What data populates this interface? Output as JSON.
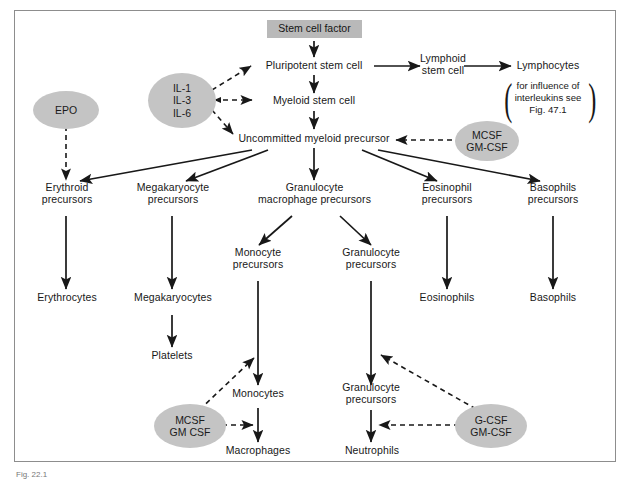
{
  "figure": {
    "caption": "Fig. 22.1",
    "border_color": "#8d8d8d",
    "box_fill": "#b9b9b9",
    "oval_fill": "#c4c4c4",
    "line_color": "#181818"
  },
  "nodes": {
    "stem_cell_factor": "Stem cell factor",
    "pluripotent_stem_cell": "Pluripotent stem cell",
    "myeloid_stem_cell": "Myeloid stem cell",
    "lymphoid_stem_cell": "Lymphoid\nstem cell",
    "lymphocytes": "Lymphocytes",
    "interleukin_note": "for influence of\ninterleukins see\nFig. 47.1",
    "uncommitted_myeloid_precursor": "Uncommitted myeloid precursor",
    "erythroid_precursors": "Erythroid\nprecursors",
    "megakaryocyte_precursors": "Megakaryocyte\nprecursors",
    "granulocyte_macrophage_precursors": "Granulocyte\nmacrophage precursors",
    "eosinophil_precursors": "Eosinophil\nprecursors",
    "basophils_precursors": "Basophils\nprecursors",
    "erythrocytes": "Erythrocytes",
    "megakaryocytes": "Megakaryocytes",
    "platelets": "Platelets",
    "monocyte_precursors": "Monocyte\nprecursors",
    "granulocyte_precursors_upper": "Granulocyte\nprecursors",
    "eosinophils": "Eosinophils",
    "basophils": "Basophils",
    "monocytes": "Monocytes",
    "granulocyte_precursors_lower": "Granulocyte\nprecursors",
    "macrophages": "Macrophages",
    "neutrophils": "Neutrophils"
  },
  "growth_factors": {
    "epo": "EPO",
    "interleukins": "IL-1\nIL-3\nIL-6",
    "mcsf_gmcsf_top": "MCSF\nGM-CSF",
    "mcsf_gmcsf_bottom": "MCSF\nGM CSF",
    "gcsf_gmcsf": "G-CSF\nGM-CSF"
  },
  "legend": {
    "solid_arrow": "differentiation pathway",
    "dashed_arrow": "stimulating growth factor"
  }
}
